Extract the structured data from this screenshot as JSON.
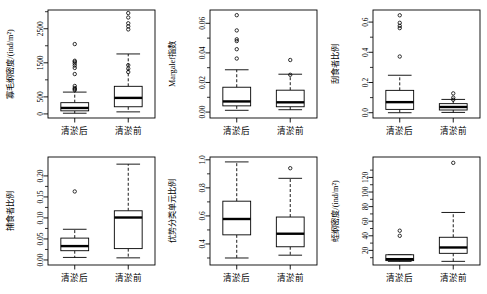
{
  "figure": {
    "groups": [
      "清淤后",
      "清淤前"
    ],
    "panel_count": 6
  },
  "chart_data": [
    {
      "type": "box",
      "panel_index": 1,
      "title": "",
      "ylabel": "寡毛纲密度/(ind/m²)",
      "xlabel": "",
      "categories": [
        "清淤后",
        "清淤前"
      ],
      "ylim": [
        -120,
        3050
      ],
      "yticks": [
        0,
        500,
        1500,
        2500
      ],
      "ytick_labels": [
        "0",
        "500",
        "1500",
        "2500"
      ],
      "yminor": [
        1000,
        2000,
        3000
      ],
      "grid": false,
      "boxes": [
        {
          "name": "清淤后",
          "whisker_low": 20,
          "q1": 90,
          "median": 175,
          "q3": 330,
          "whisker_high": 640,
          "outliers": [
            700,
            730,
            760,
            820,
            1170,
            1350,
            1420,
            1480,
            1530,
            1560,
            2050
          ]
        },
        {
          "name": "清淤前",
          "whisker_low": 60,
          "q1": 210,
          "median": 470,
          "q3": 810,
          "whisker_high": 1760,
          "outliers": [
            1230,
            1330,
            1430,
            2480,
            2570,
            2660,
            2830,
            2960
          ]
        }
      ]
    },
    {
      "type": "box",
      "panel_index": 2,
      "title": "",
      "ylabel": "Margalef指数",
      "xlabel": "",
      "categories": [
        "清淤后",
        "清淤前"
      ],
      "ylim": [
        -0.004,
        0.069
      ],
      "yticks": [
        0.0,
        0.02,
        0.04,
        0.06
      ],
      "ytick_labels": [
        "0.00",
        "0.02",
        "0.04",
        "0.06"
      ],
      "yminor": [
        0.01,
        0.03,
        0.05
      ],
      "grid": false,
      "boxes": [
        {
          "name": "清淤后",
          "whisker_low": 0.0012,
          "q1": 0.0042,
          "median": 0.0072,
          "q3": 0.0168,
          "whisker_high": 0.0286,
          "outliers": [
            0.0362,
            0.0425,
            0.048,
            0.0492,
            0.0552,
            0.0655
          ]
        },
        {
          "name": "清淤前",
          "whisker_low": 0.0016,
          "q1": 0.0036,
          "median": 0.0066,
          "q3": 0.0148,
          "whisker_high": 0.0256,
          "outliers": [
            0.0252,
            0.0352
          ]
        }
      ]
    },
    {
      "type": "box",
      "panel_index": 3,
      "title": "",
      "ylabel": "刮食者比例",
      "xlabel": "",
      "categories": [
        "清淤后",
        "清淤前"
      ],
      "ylim": [
        -0.035,
        0.68
      ],
      "yticks": [
        0.0,
        0.2,
        0.4,
        0.6
      ],
      "ytick_labels": [
        "0.0",
        "0.2",
        "0.4",
        "0.6"
      ],
      "yminor": [
        0.1,
        0.3,
        0.5
      ],
      "grid": false,
      "boxes": [
        {
          "name": "清淤后",
          "whisker_low": 0.0,
          "q1": 0.022,
          "median": 0.07,
          "q3": 0.148,
          "whisker_high": 0.248,
          "outliers": [
            0.372,
            0.56,
            0.575,
            0.595,
            0.645
          ]
        },
        {
          "name": "清淤前",
          "whisker_low": 0.002,
          "q1": 0.018,
          "median": 0.038,
          "q3": 0.06,
          "whisker_high": 0.088,
          "outliers": [
            0.086,
            0.1,
            0.128
          ]
        }
      ]
    },
    {
      "type": "box",
      "panel_index": 4,
      "title": "",
      "ylabel": "捕食者比例",
      "xlabel": "",
      "categories": [
        "清淤后",
        "清淤前"
      ],
      "ylim": [
        -0.012,
        0.245
      ],
      "yticks": [
        0.0,
        0.05,
        0.1,
        0.15,
        0.2
      ],
      "ytick_labels": [
        "0.00",
        "0.05",
        "0.10",
        "0.15",
        "0.20"
      ],
      "yminor": [
        0.025,
        0.075,
        0.125,
        0.175
      ],
      "grid": false,
      "boxes": [
        {
          "name": "清淤后",
          "whisker_low": 0.006,
          "q1": 0.022,
          "median": 0.033,
          "q3": 0.052,
          "whisker_high": 0.073,
          "outliers": [
            0.163
          ]
        },
        {
          "name": "清淤前",
          "whisker_low": 0.005,
          "q1": 0.027,
          "median": 0.101,
          "q3": 0.117,
          "whisker_high": 0.228,
          "outliers": []
        }
      ]
    },
    {
      "type": "box",
      "panel_index": 5,
      "title": "",
      "ylabel": "优势分类单元比例",
      "xlabel": "",
      "categories": [
        "清淤后",
        "清淤前"
      ],
      "ylim": [
        0.25,
        1.02
      ],
      "yticks": [
        0.4,
        0.6,
        0.8,
        1.0
      ],
      "ytick_labels": [
        "0.4",
        "0.6",
        "0.8",
        "1.0"
      ],
      "yminor": [
        0.3,
        0.5,
        0.7,
        0.9
      ],
      "grid": false,
      "boxes": [
        {
          "name": "清淤后",
          "whisker_low": 0.3,
          "q1": 0.465,
          "median": 0.578,
          "q3": 0.705,
          "whisker_high": 0.985,
          "outliers": []
        },
        {
          "name": "清淤前",
          "whisker_low": 0.32,
          "q1": 0.38,
          "median": 0.473,
          "q3": 0.592,
          "whisker_high": 0.868,
          "outliers": [
            0.94
          ]
        }
      ]
    },
    {
      "type": "box",
      "panel_index": 6,
      "title": "",
      "ylabel": "蛭纲密度/(ind/m²)",
      "xlabel": "",
      "categories": [
        "清淤后",
        "清淤前"
      ],
      "ylim": [
        0,
        148
      ],
      "yticks": [
        20,
        40,
        60,
        80,
        100,
        120
      ],
      "ytick_labels": [
        "20",
        "40",
        "60",
        "80",
        "100",
        "120"
      ],
      "yminor": [
        10,
        30,
        50,
        70,
        90,
        110,
        130
      ],
      "grid": false,
      "boxes": [
        {
          "name": "清淤后",
          "whisker_low": 5,
          "q1": 6,
          "median": 8,
          "q3": 14,
          "whisker_high": 14,
          "outliers": [
            40,
            47
          ]
        },
        {
          "name": "清淤前",
          "whisker_low": 5,
          "q1": 16,
          "median": 24,
          "q3": 38,
          "whisker_high": 72,
          "outliers": [
            140
          ]
        }
      ]
    }
  ]
}
